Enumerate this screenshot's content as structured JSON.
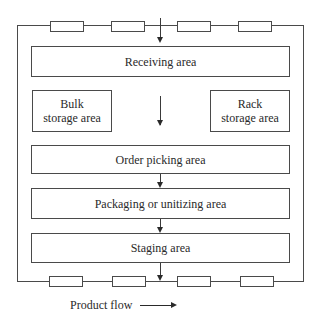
{
  "diagram": {
    "areas": {
      "receiving": "Receiving area",
      "bulk_line1": "Bulk",
      "bulk_line2": "storage area",
      "rack_line1": "Rack",
      "rack_line2": "storage area",
      "order_picking": "Order picking area",
      "packaging": "Packaging or unitizing area",
      "staging": "Staging area"
    },
    "top_doors_count": 4,
    "bottom_doors_count": 4,
    "legend": {
      "label": "Product flow",
      "icon": "right-arrow-icon"
    },
    "colors": {
      "line": "#4a4a4a",
      "text": "#2a2a2a",
      "background": "#ffffff"
    }
  }
}
